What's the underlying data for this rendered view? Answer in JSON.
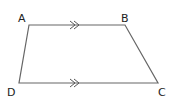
{
  "diagram": {
    "type": "trapezium",
    "stroke_color": "#555555",
    "vertices": [
      {
        "label": "A",
        "x": 29,
        "y": 25,
        "lx": 18,
        "ly": 22
      },
      {
        "label": "B",
        "x": 125,
        "y": 25,
        "lx": 122,
        "ly": 22
      },
      {
        "label": "C",
        "x": 158,
        "y": 83,
        "lx": 158,
        "ly": 95
      },
      {
        "label": "D",
        "x": 19,
        "y": 83,
        "lx": 8,
        "ly": 95
      }
    ],
    "parallel_marks": [
      {
        "side": "AB",
        "x": 76,
        "y": 25,
        "symbol": ">>"
      },
      {
        "side": "DC",
        "x": 76,
        "y": 83,
        "symbol": ">>"
      }
    ]
  }
}
